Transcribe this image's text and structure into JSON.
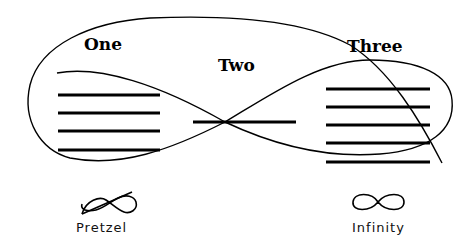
{
  "diagram": {
    "regions": [
      {
        "id": "one",
        "label": "One",
        "line_count": 4
      },
      {
        "id": "two",
        "label": "Two",
        "line_count": 1
      },
      {
        "id": "three",
        "label": "Three",
        "line_count": 5
      }
    ],
    "legend": [
      {
        "symbol": "pretzel-curve",
        "label": "Pretzel"
      },
      {
        "symbol": "infinity-curve",
        "label": "Infinity"
      }
    ],
    "colors": {
      "ink": "#000000",
      "background": "#ffffff"
    }
  }
}
